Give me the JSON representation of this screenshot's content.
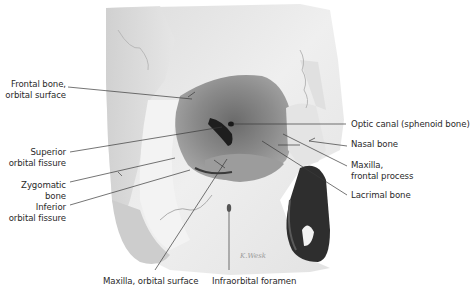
{
  "figure": {
    "labels_left": [
      {
        "id": "frontal-bone-orbital-surface",
        "lines": [
          "Frontal bone,",
          "orbital surface"
        ]
      },
      {
        "id": "superior-orbital-fissure",
        "lines": [
          "Superior",
          "orbital fissure"
        ]
      },
      {
        "id": "zygomatic-bone",
        "lines": [
          "Zygomatic",
          "bone"
        ]
      },
      {
        "id": "inferior-orbital-fissure",
        "lines": [
          "Inferior",
          "orbital fissure"
        ]
      }
    ],
    "labels_right": [
      {
        "id": "optic-canal",
        "lines": [
          "Optic canal (sphenoid bone)"
        ]
      },
      {
        "id": "nasal-bone",
        "lines": [
          "Nasal bone"
        ]
      },
      {
        "id": "maxilla-frontal-process",
        "lines": [
          "Maxilla,",
          "frontal process"
        ]
      },
      {
        "id": "lacrimal-bone",
        "lines": [
          "Lacrimal bone"
        ]
      }
    ],
    "labels_bottom": [
      {
        "id": "maxilla-orbital-surface",
        "lines": [
          "Maxilla, orbital surface"
        ]
      },
      {
        "id": "infraorbital-foramen",
        "lines": [
          "Infraorbital foramen"
        ]
      }
    ],
    "colors": {
      "background": "#ffffff",
      "bone_light": "#ececec",
      "bone_mid": "#d4d4d4",
      "orbit_dark": "#7a7a7a",
      "nasal_cavity": "#2e2e2e",
      "leader_line": "#3a3a3a",
      "label_text": "#2a2a2a"
    }
  }
}
